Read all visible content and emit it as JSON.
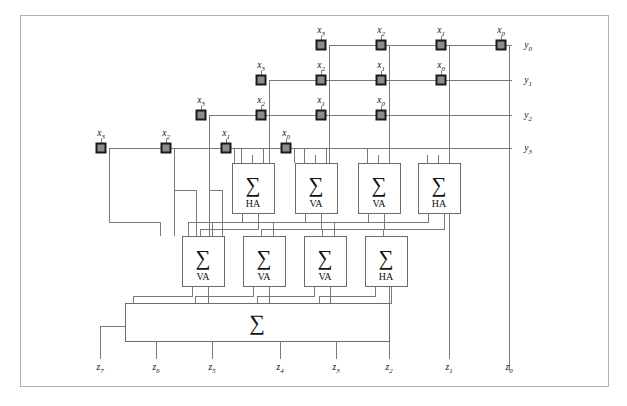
{
  "figure": {
    "caption": "",
    "frame": {
      "x": 20,
      "y": 15,
      "width": 588,
      "height": 371,
      "stroke": "#b3b3b3"
    },
    "colors": {
      "wire": "#7a7a7a",
      "node_fill": "#8c8c8c",
      "node_stroke": "#1a1a1a",
      "box_stroke": "#6b6b6b",
      "text": "#111111",
      "background": "#ffffff"
    }
  },
  "operand_rows": [
    {
      "name": "y0-row",
      "y_label": "y",
      "y_sub": "0",
      "y_text": "y0",
      "wire_y": 45,
      "label_x": 520,
      "nodes": [
        {
          "x": 329,
          "x_label": "x",
          "x_sub": "3",
          "x_text": "x3"
        },
        {
          "x": 389,
          "x_label": "x",
          "x_sub": "2",
          "x_text": "x2"
        },
        {
          "x": 449,
          "x_label": "x",
          "x_sub": "1",
          "x_text": "x1"
        },
        {
          "x": 509,
          "x_label": "x",
          "x_sub": "0",
          "x_text": "x0"
        }
      ]
    },
    {
      "name": "y1-row",
      "y_label": "y",
      "y_sub": "1",
      "y_text": "y1",
      "wire_y": 80,
      "label_x": 520,
      "nodes": [
        {
          "x": 269,
          "x_label": "x",
          "x_sub": "3",
          "x_text": "x3"
        },
        {
          "x": 329,
          "x_label": "x",
          "x_sub": "2",
          "x_text": "x2"
        },
        {
          "x": 389,
          "x_label": "x",
          "x_sub": "1",
          "x_text": "x1"
        },
        {
          "x": 449,
          "x_label": "x",
          "x_sub": "0",
          "x_text": "x0"
        }
      ]
    },
    {
      "name": "y2-row",
      "y_label": "y",
      "y_sub": "2",
      "y_text": "y2",
      "wire_y": 115,
      "label_x": 520,
      "nodes": [
        {
          "x": 209,
          "x_label": "x",
          "x_sub": "3",
          "x_text": "x3"
        },
        {
          "x": 269,
          "x_label": "x",
          "x_sub": "2",
          "x_text": "x2"
        },
        {
          "x": 329,
          "x_label": "x",
          "x_sub": "1",
          "x_text": "x1"
        },
        {
          "x": 389,
          "x_label": "x",
          "x_sub": "0",
          "x_text": "x0"
        }
      ]
    },
    {
      "name": "y3-row",
      "y_label": "y",
      "y_sub": "3",
      "y_text": "y3",
      "wire_y": 148,
      "label_x": 520,
      "nodes": [
        {
          "x": 109,
          "x_label": "x",
          "x_sub": "3",
          "x_text": "x3"
        },
        {
          "x": 174,
          "x_label": "x",
          "x_sub": "2",
          "x_text": "x2"
        },
        {
          "x": 234,
          "x_label": "x",
          "x_sub": "1",
          "x_text": "x1"
        },
        {
          "x": 294,
          "x_label": "x",
          "x_sub": "0",
          "x_text": "x0"
        }
      ]
    }
  ],
  "adder_row_1": {
    "name": "first-adder-stage",
    "top": 163,
    "height": 50,
    "width": 42,
    "sigma": "∑",
    "boxes": [
      {
        "x": 232,
        "type": "HA"
      },
      {
        "x": 295,
        "type": "VA"
      },
      {
        "x": 358,
        "type": "VA"
      },
      {
        "x": 418,
        "type": "HA"
      }
    ]
  },
  "adder_row_2": {
    "name": "second-adder-stage",
    "top": 236,
    "height": 50,
    "width": 42,
    "sigma": "∑",
    "boxes": [
      {
        "x": 182,
        "type": "VA"
      },
      {
        "x": 243,
        "type": "VA"
      },
      {
        "x": 304,
        "type": "VA"
      },
      {
        "x": 365,
        "type": "HA"
      }
    ]
  },
  "final_adder": {
    "name": "final-carry-propagate-adder",
    "x": 125,
    "y": 303,
    "width": 264,
    "height": 38,
    "sigma": "∑",
    "label": "∑"
  },
  "outputs": [
    {
      "name": "z7",
      "text": "z7",
      "base": "z",
      "sub": "7",
      "x": 100,
      "label_y": 370,
      "line_top": 326
    },
    {
      "name": "z6",
      "text": "z6",
      "base": "z",
      "sub": "6",
      "x": 156,
      "label_y": 370,
      "line_top": 341
    },
    {
      "name": "z5",
      "text": "z5",
      "base": "z",
      "sub": "5",
      "x": 212,
      "label_y": 370,
      "line_top": 341
    },
    {
      "name": "z4",
      "text": "z4",
      "base": "z",
      "sub": "4",
      "x": 280,
      "label_y": 370,
      "line_top": 341
    },
    {
      "name": "z3",
      "text": "z3",
      "base": "z",
      "sub": "3",
      "x": 336,
      "label_y": 370,
      "line_top": 341
    },
    {
      "name": "z2",
      "text": "z2",
      "base": "z",
      "sub": "2",
      "x": 389,
      "label_y": 370,
      "line_top": 286
    },
    {
      "name": "z1",
      "text": "z1",
      "base": "z",
      "sub": "1",
      "x": 449,
      "label_y": 370,
      "line_top": 213
    },
    {
      "name": "z0",
      "text": "z0",
      "base": "z",
      "sub": "0",
      "x": 509,
      "label_y": 370,
      "line_top": 45
    }
  ]
}
